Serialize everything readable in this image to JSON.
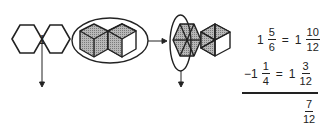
{
  "figures": {
    "whole_label": "1",
    "figure1": {
      "description": "two-hexagon outline labelled 1 (one whole)"
    },
    "figure2": {
      "description": "two hexagons shaded as cubes inside ellipse"
    },
    "figure3": {
      "description": "two hexagons divided into twelfths; 10 of 12 shaded, left hexagon circled"
    }
  },
  "math": {
    "line1": {
      "whole": "1",
      "num": "5",
      "den": "6",
      "eq": "=",
      "whole2": "1",
      "num2": "10",
      "den2": "12"
    },
    "line2": {
      "whole": "−1",
      "num": "1",
      "den": "4",
      "eq": "=",
      "whole2": "1",
      "num2": "3",
      "den2": "12"
    },
    "result": {
      "num": "7",
      "den": "12"
    }
  },
  "colors": {
    "stroke": "#222222",
    "shade": "#9a9a9a",
    "background": "#ffffff"
  }
}
